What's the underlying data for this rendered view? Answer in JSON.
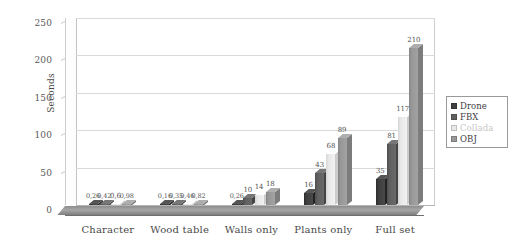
{
  "chart_data": {
    "type": "bar",
    "title": "",
    "xlabel": "",
    "ylabel": "Seconds",
    "ylim": [
      0,
      250
    ],
    "yticks": [
      0,
      50,
      100,
      150,
      200,
      250
    ],
    "grid": true,
    "legend_position": "right",
    "categories": [
      "Character",
      "Wood table",
      "Walls only",
      "Plants only",
      "Full set"
    ],
    "series": [
      {
        "name": "Drone",
        "color": "#3f3f3f",
        "values": [
          0.26,
          0.16,
          0.26,
          16,
          35
        ]
      },
      {
        "name": "FBX",
        "color": "#606060",
        "values": [
          0.42,
          0.35,
          10,
          43,
          81
        ]
      },
      {
        "name": "Collada",
        "color": "#e8e8e8",
        "values": [
          0.6,
          0.46,
          14,
          68,
          117
        ]
      },
      {
        "name": "OBJ",
        "color": "#989898",
        "values": [
          0.98,
          0.82,
          18,
          89,
          210
        ]
      }
    ],
    "value_labels": [
      [
        "0,26",
        "0,42",
        "0,6",
        "0,98"
      ],
      [
        "0,16",
        "0,35",
        "0,46",
        "0,82"
      ],
      [
        "0,26",
        "10",
        "14",
        "18"
      ],
      [
        "16",
        "43",
        "68",
        "89"
      ],
      [
        "35",
        "81",
        "117",
        "210"
      ]
    ]
  },
  "legend": {
    "items": [
      {
        "label": "Drone"
      },
      {
        "label": "FBX"
      },
      {
        "label": "Collada"
      },
      {
        "label": "OBJ"
      }
    ]
  }
}
